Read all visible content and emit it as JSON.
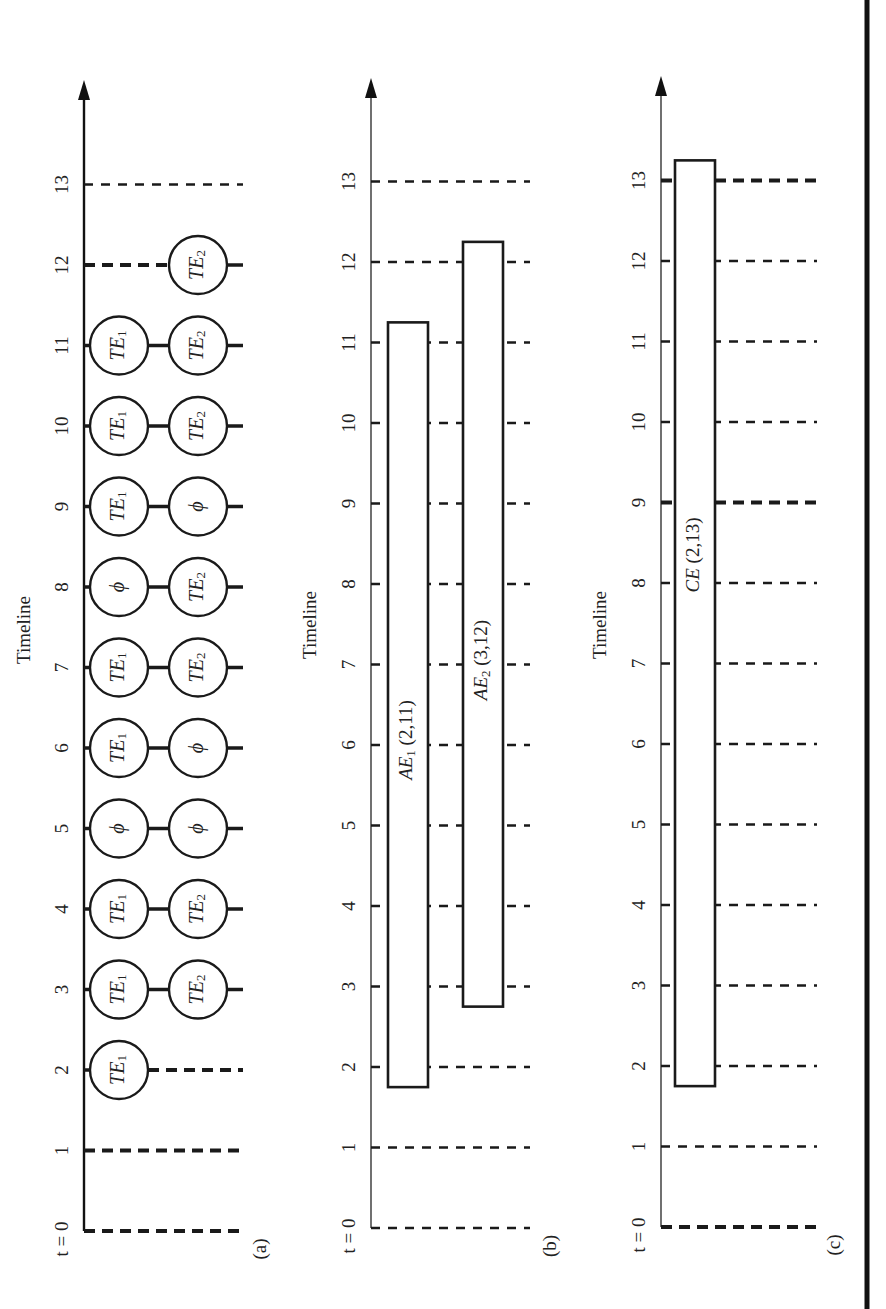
{
  "figure": {
    "axis_title": "Timeline",
    "tick_labels": [
      "t = 0",
      "1",
      "2",
      "3",
      "4",
      "5",
      "6",
      "7",
      "8",
      "9",
      "10",
      "11",
      "12",
      "13"
    ],
    "colors": {
      "ink": "#1a1a1a",
      "background": "#ffffff"
    }
  },
  "panels": [
    {
      "id": "a",
      "label": "(a)",
      "axis_title": "Timeline",
      "kind": "tuple-events",
      "bold_dashed_ticks": [
        0,
        1,
        2,
        12
      ],
      "rows": [
        {
          "name": "TE1-row",
          "prefix": "TE",
          "sub": "1",
          "null_symbol": "ϕ",
          "values": {
            "2": "TE1",
            "3": "TE1",
            "4": "TE1",
            "5": "ϕ",
            "6": "TE1",
            "7": "TE1",
            "8": "ϕ",
            "9": "TE1",
            "10": "TE1",
            "11": "TE1"
          }
        },
        {
          "name": "TE2-row",
          "prefix": "TE",
          "sub": "2",
          "null_symbol": "ϕ",
          "values": {
            "3": "TE2",
            "4": "TE2",
            "5": "ϕ",
            "6": "ϕ",
            "7": "TE2",
            "8": "TE2",
            "9": "ϕ",
            "10": "TE2",
            "11": "TE2",
            "12": "TE2"
          }
        }
      ]
    },
    {
      "id": "b",
      "label": "(b)",
      "axis_title": "Timeline",
      "kind": "atomic-events",
      "bars": [
        {
          "name": "AE1",
          "prefix": "AE",
          "sub": "1",
          "suffix": " (2,11)",
          "start": 2,
          "end": 11
        },
        {
          "name": "AE2",
          "prefix": "AE",
          "sub": "2",
          "suffix": " (3,12)",
          "start": 3,
          "end": 12
        }
      ]
    },
    {
      "id": "c",
      "label": "(c)",
      "axis_title": "Timeline",
      "kind": "complex-event",
      "bold_dashed_ticks": [
        0,
        9,
        13
      ],
      "bars": [
        {
          "name": "CE",
          "prefix": "CE",
          "sub": "",
          "suffix": " (2,13)",
          "start": 2,
          "end": 13
        }
      ]
    }
  ]
}
